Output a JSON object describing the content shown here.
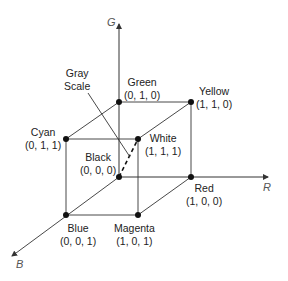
{
  "axes": {
    "g": "G",
    "r": "R",
    "b": "B"
  },
  "vertices": {
    "green": {
      "name": "Green",
      "coords": "(0, 1, 0)"
    },
    "yellow": {
      "name": "Yellow",
      "coords": "(1, 1, 0)"
    },
    "cyan": {
      "name": "Cyan",
      "coords": "(0, 1, 1)"
    },
    "white": {
      "name": "White",
      "coords": "(1, 1, 1)"
    },
    "black": {
      "name": "Black",
      "coords": "(0, 0, 0)"
    },
    "red": {
      "name": "Red",
      "coords": "(1, 0, 0)"
    },
    "blue": {
      "name": "Blue",
      "coords": "(0, 0, 1)"
    },
    "magenta": {
      "name": "Magenta",
      "coords": "(1, 0, 1)"
    }
  },
  "gray_scale": {
    "line1": "Gray",
    "line2": "Scale"
  },
  "colors": {
    "line": "#333333",
    "vertex": "#111111",
    "axis_label": "#555555"
  }
}
